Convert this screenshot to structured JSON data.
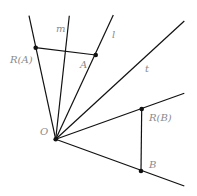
{
  "diagram": {
    "title": "",
    "points": {
      "O": {
        "label": "O",
        "x": 55.7,
        "y": 139.3
      },
      "A": {
        "label": "A",
        "x": 95.7,
        "y": 55
      },
      "RA": {
        "label": "R(A)",
        "x": 35.7,
        "y": 47.7
      },
      "B": {
        "label": "B",
        "x": 141,
        "y": 171
      },
      "RB": {
        "label": "R(B)",
        "x": 141.7,
        "y": 109
      }
    },
    "lines": {
      "m": {
        "label": "m"
      },
      "l": {
        "label": "l"
      },
      "t": {
        "label": "t"
      }
    },
    "colors": {
      "line": "#111111",
      "label": "#8a8a8a"
    }
  }
}
